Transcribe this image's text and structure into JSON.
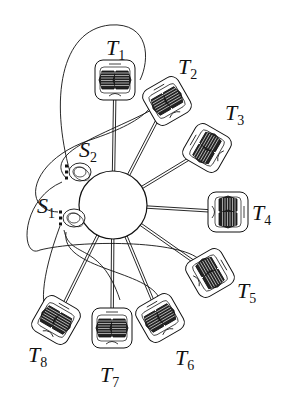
{
  "diagram": {
    "hub": {
      "cx": 113,
      "cy": 205,
      "r": 34
    },
    "nodes": [
      {
        "id": "T1",
        "label": "T",
        "sub": "1",
        "x": 115,
        "y": 80,
        "angle": 0,
        "lx": 106,
        "ly": 55
      },
      {
        "id": "T2",
        "label": "T",
        "sub": "2",
        "x": 167,
        "y": 101,
        "angle": -30,
        "lx": 178,
        "ly": 74
      },
      {
        "id": "T3",
        "label": "T",
        "sub": "3",
        "x": 207,
        "y": 148,
        "angle": -60,
        "lx": 225,
        "ly": 120
      },
      {
        "id": "T4",
        "label": "T",
        "sub": "4",
        "x": 228,
        "y": 212,
        "angle": 90,
        "lx": 252,
        "ly": 220
      },
      {
        "id": "T5",
        "label": "T",
        "sub": "5",
        "x": 210,
        "y": 273,
        "angle": 60,
        "lx": 237,
        "ly": 298
      },
      {
        "id": "T6",
        "label": "T",
        "sub": "6",
        "x": 160,
        "y": 318,
        "angle": -30,
        "lx": 175,
        "ly": 365
      },
      {
        "id": "T7",
        "label": "T",
        "sub": "7",
        "x": 112,
        "y": 328,
        "angle": 0,
        "lx": 100,
        "ly": 382
      },
      {
        "id": "T8",
        "label": "T",
        "sub": "8",
        "x": 56,
        "y": 320,
        "angle": 30,
        "lx": 28,
        "ly": 362
      }
    ],
    "switches": [
      {
        "id": "S1",
        "label": "S",
        "sub": "1",
        "x": 74,
        "y": 218,
        "lx": 37,
        "ly": 213
      },
      {
        "id": "S2",
        "label": "S",
        "sub": "2",
        "x": 80,
        "y": 172,
        "lx": 79,
        "ly": 157
      }
    ],
    "colors": {
      "stroke": "#111111",
      "background": "#ffffff"
    }
  }
}
